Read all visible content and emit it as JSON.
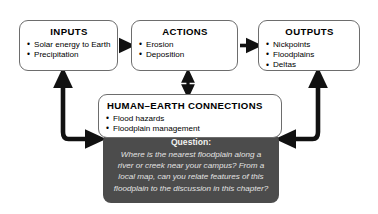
{
  "diagram": {
    "colors": {
      "box_border": "#6d6d6d",
      "box_fill": "#ffffff",
      "question_fill": "#4c4c4c",
      "question_text": "#e2e2e2",
      "arrow": "#111111",
      "text": "#000000"
    },
    "boxes": [
      {
        "id": "inputs",
        "title": "INPUTS",
        "items": [
          "Solar energy to Earth",
          "Precipitation"
        ]
      },
      {
        "id": "actions",
        "title": "ACTIONS",
        "items": [
          "Erosion",
          "Deposition"
        ]
      },
      {
        "id": "outputs",
        "title": "OUTPUTS",
        "items": [
          "Nickpoints",
          "Floodplains",
          "Deltas"
        ]
      },
      {
        "id": "human-earth",
        "title": "HUMAN–EARTH CONNECTIONS",
        "items": [
          "Flood hazards",
          "Floodplain management"
        ]
      }
    ],
    "question": {
      "label": "Question:",
      "text": "Where is the nearest floodplain along a river or creek near your campus? From a local map, can you relate features of this floodplain to the discussion in this chapter?"
    },
    "arrows": [
      {
        "id": "inputs-to-actions",
        "from": "inputs",
        "to": "actions",
        "style": "straight-right",
        "heads": 1
      },
      {
        "id": "actions-to-outputs",
        "from": "actions",
        "to": "outputs",
        "style": "straight-right",
        "heads": 1
      },
      {
        "id": "actions-to-human",
        "from": "actions",
        "to": "human-earth",
        "style": "vertical-double",
        "heads": 2
      },
      {
        "id": "question-to-inputs",
        "from": "human-earth",
        "to": "inputs",
        "style": "elbow-left",
        "heads": 2
      },
      {
        "id": "question-to-outputs",
        "from": "human-earth",
        "to": "outputs",
        "style": "elbow-right",
        "heads": 2
      }
    ]
  }
}
